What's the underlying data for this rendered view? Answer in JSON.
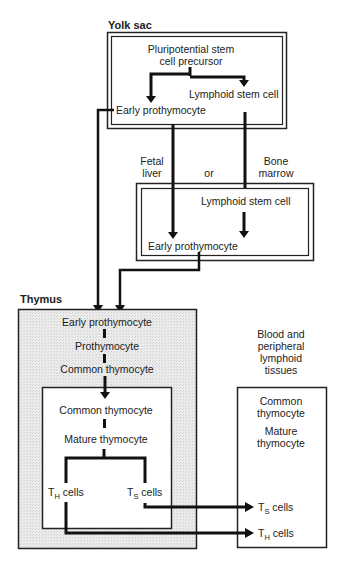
{
  "regions": {
    "yolk_sac": {
      "title": "Yolk sac",
      "precursor_line1": "Pluripotential stem",
      "precursor_line2": "cell precursor",
      "lymphoid": "Lymphoid stem cell",
      "early": "Early prothymocyte"
    },
    "intermediate": {
      "fetal_line1": "Fetal",
      "fetal_line2": "liver",
      "or": "or",
      "bone_line1": "Bone",
      "bone_line2": "marrow",
      "lymphoid": "Lymphoid stem cell",
      "early": "Early prothymocyte"
    },
    "thymus": {
      "title": "Thymus",
      "early": "Early prothymocyte",
      "prothymocyte": "Prothymocyte",
      "common": "Common thymocyte",
      "inner_common": "Common thymocyte",
      "mature": "Mature thymocyte",
      "th_main": "T",
      "th_sub": "H",
      "ts_main": "T",
      "ts_sub": "S",
      "cells": "cells"
    },
    "blood": {
      "title_line1": "Blood and",
      "title_line2": "peripheral",
      "title_line3": "lymphoid",
      "title_line4": "tissues",
      "common_line1": "Common",
      "common_line2": "thymocyte",
      "mature_line1": "Mature",
      "mature_line2": "thymocyte",
      "ts_main": "T",
      "ts_sub": "S",
      "th_main": "T",
      "th_sub": "H",
      "cells": "cells"
    }
  },
  "colors": {
    "line": "#111111",
    "box": "#222222",
    "thymus_fill": "#e6e6e6"
  }
}
